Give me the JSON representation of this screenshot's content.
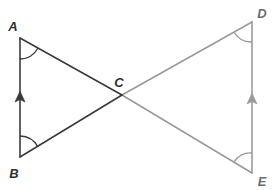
{
  "figure": {
    "type": "geometry-diagram",
    "width": 277,
    "height": 190,
    "background_color": "#ffffff",
    "colors": {
      "dark_stroke": "#3a3a3a",
      "light_stroke": "#9a9a9a",
      "label_dark": "#2f2f2f",
      "label_light": "#6d6d6d"
    },
    "points": {
      "A": {
        "label": "A",
        "x": 20,
        "y": 38,
        "label_x": 13,
        "label_y": 31
      },
      "B": {
        "label": "B",
        "x": 20,
        "y": 157,
        "label_x": 13,
        "label_y": 178
      },
      "C": {
        "label": "C",
        "x": 122,
        "y": 95,
        "label_x": 116,
        "label_y": 87
      },
      "D": {
        "label": "D",
        "x": 252,
        "y": 22,
        "label_x": 258,
        "label_y": 18
      },
      "E": {
        "label": "E",
        "x": 252,
        "y": 173,
        "label_x": 258,
        "label_y": 186
      }
    },
    "segments": [
      {
        "name": "segment-AB",
        "from": "A",
        "to": "B",
        "color": "#3a3a3a",
        "width": 1.6,
        "tick_marks": "single-arrow-up"
      },
      {
        "name": "segment-AE",
        "from": "A",
        "to": "E",
        "color": "#3a3a3a",
        "width": 1.6
      },
      {
        "name": "segment-BD",
        "from": "B",
        "to": "D",
        "color": "#3a3a3a",
        "width": 1.6
      },
      {
        "name": "segment-CD",
        "from": "C",
        "to": "D",
        "color": "#9a9a9a",
        "width": 1.6
      },
      {
        "name": "segment-CE",
        "from": "C",
        "to": "E",
        "color": "#9a9a9a",
        "width": 1.6
      },
      {
        "name": "segment-DE",
        "from": "D",
        "to": "E",
        "color": "#9a9a9a",
        "width": 1.6,
        "tick_marks": "single-arrow-up"
      }
    ],
    "angle_arcs": [
      {
        "name": "angle-arc-A",
        "vertex": "A",
        "color": "#3a3a3a"
      },
      {
        "name": "angle-arc-B",
        "vertex": "B",
        "color": "#3a3a3a"
      },
      {
        "name": "angle-arc-D",
        "vertex": "D",
        "color": "#9a9a9a"
      },
      {
        "name": "angle-arc-E",
        "vertex": "E",
        "color": "#9a9a9a"
      }
    ],
    "parallel_markers": [
      {
        "name": "parallel-arrow-AB",
        "x": 20,
        "y": 98,
        "color": "#3a3a3a"
      },
      {
        "name": "parallel-arrow-DE",
        "x": 252,
        "y": 100,
        "color": "#9a9a9a"
      }
    ]
  }
}
